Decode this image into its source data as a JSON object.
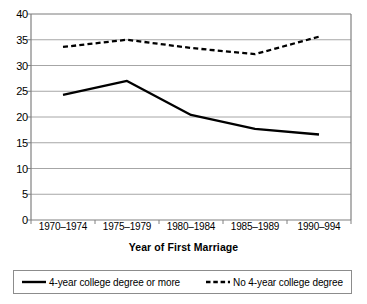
{
  "chart_data": {
    "type": "line",
    "title": "",
    "subtitle": "",
    "xlabel": "Year of First Marriage",
    "ylabel": "",
    "categories": [
      "1970–1974",
      "1975–1979",
      "1980–1984",
      "1985–1989",
      "1990–994"
    ],
    "series": [
      {
        "name": "4-year college degree or more",
        "style": "solid",
        "color": "#000000",
        "values": [
          24.3,
          27.0,
          20.4,
          17.7,
          16.6
        ]
      },
      {
        "name": "No 4-year college degree",
        "style": "dashed",
        "color": "#000000",
        "values": [
          33.6,
          35.0,
          33.4,
          32.2,
          35.6
        ]
      }
    ],
    "ylim": [
      0,
      40
    ],
    "ytick_step": 5,
    "yticks": [
      "40",
      "35",
      "30",
      "25",
      "20",
      "15",
      "10",
      "5",
      "0"
    ],
    "grid": "horizontal",
    "legend_position": "bottom",
    "axis_color": "#808080",
    "grid_color": "#a6a6a6"
  },
  "legend": {
    "entries": [
      {
        "label": "4-year college degree or more",
        "swatch": "solid-line-icon"
      },
      {
        "label": "No 4-year college degree",
        "swatch": "dashed-line-icon"
      }
    ]
  }
}
